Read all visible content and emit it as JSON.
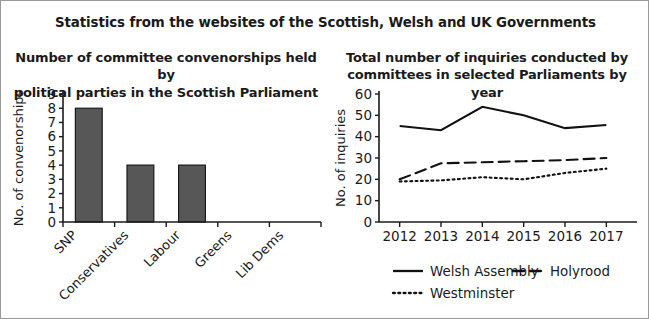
{
  "figure": {
    "main_title": "Statistics from the websites of the Scottish, Welsh and UK Governments",
    "border_color": "#9a9a9a",
    "background": "#ffffff"
  },
  "left_panel": {
    "title_line1": "Number of committee convenorships held by",
    "title_line2": "political parties in the Scottish Parliament"
  },
  "right_panel": {
    "title_line1": "Total number of inquiries conducted by",
    "title_line2": "committees in selected Parliaments by year"
  },
  "chart_data": [
    {
      "type": "bar",
      "title": "Number of committee convenorships held by political parties in the Scottish Parliament",
      "xlabel": "",
      "ylabel": "No. of convenorships",
      "categories": [
        "SNP",
        "Conservatives",
        "Labour",
        "Greens",
        "Lib Dems"
      ],
      "values": [
        8,
        4,
        4,
        0,
        0
      ],
      "ylim": [
        0,
        9
      ],
      "yticks": [
        0,
        1,
        2,
        3,
        4,
        5,
        6,
        7,
        8,
        9
      ],
      "ytick_labels": [
        "0",
        "1",
        "2",
        "3",
        "4",
        "5",
        "6",
        "7",
        "8",
        "9"
      ],
      "bar_color": "#575757",
      "bar_edge_color": "#1a1a1a",
      "grid": false,
      "legend": "none",
      "xtick_rotation_deg": 45
    },
    {
      "type": "line",
      "title": "Total number of inquiries conducted by committees in selected Parliaments by year",
      "xlabel": "",
      "ylabel": "No. of inquiries",
      "x": [
        "2012",
        "2013",
        "2014",
        "2015",
        "2016",
        "2017"
      ],
      "ylim": [
        0,
        60
      ],
      "yticks": [
        0,
        10,
        20,
        30,
        40,
        50,
        60
      ],
      "ytick_labels": [
        "0",
        "10",
        "20",
        "30",
        "40",
        "50",
        "60"
      ],
      "grid": false,
      "legend_position": "below",
      "series": [
        {
          "name": "Welsh Assembly",
          "style": "solid",
          "color": "#111111",
          "values": [
            45,
            43,
            54,
            50,
            44,
            45.5
          ]
        },
        {
          "name": "Holyrood",
          "style": "dashed",
          "color": "#111111",
          "values": [
            20,
            27.5,
            28,
            28.5,
            29,
            30
          ]
        },
        {
          "name": "Westminster",
          "style": "dotted",
          "color": "#111111",
          "values": [
            19,
            19.5,
            21,
            20,
            23,
            25
          ]
        }
      ]
    }
  ]
}
